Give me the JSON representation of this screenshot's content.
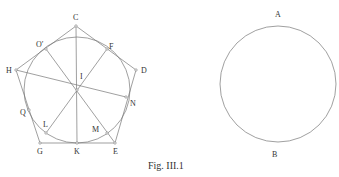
{
  "figure": {
    "caption": "Fig. III.1",
    "left": {
      "labels": {
        "C": "C",
        "O": "O′",
        "F": "F",
        "H": "H",
        "D": "D",
        "I": "I",
        "N": "N",
        "Q": "Q",
        "L": "L",
        "M": "M",
        "G": "G",
        "K": "K",
        "E": "E"
      }
    },
    "right": {
      "labels": {
        "A": "A",
        "B": "B"
      }
    }
  }
}
